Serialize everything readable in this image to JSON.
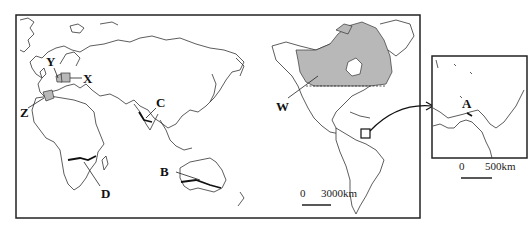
{
  "map": {
    "main_frame": {
      "x": 16,
      "y": 15,
      "width": 404,
      "height": 203
    },
    "inset_frame": {
      "x": 432,
      "y": 56,
      "width": 95,
      "height": 102
    },
    "shade_color": "#b8b8b8",
    "labels": {
      "Y": "Y",
      "X": "X",
      "Z": "Z",
      "C": "C",
      "D": "D",
      "B": "B",
      "W": "W",
      "A": "A"
    },
    "scale_main": {
      "zero": "0",
      "distance": "3000km"
    },
    "scale_inset": {
      "zero": "0",
      "distance": "500km"
    }
  }
}
